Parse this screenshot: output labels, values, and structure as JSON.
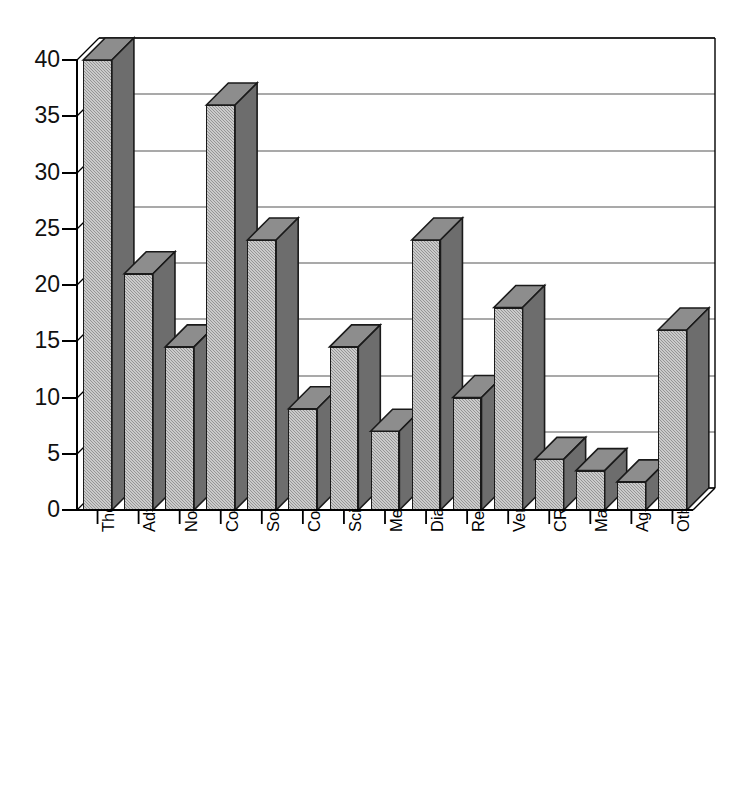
{
  "chart_data": {
    "type": "bar",
    "title": "",
    "subtitle": "",
    "xlabel": "",
    "ylabel": "",
    "ylim": [
      0,
      40
    ],
    "ytick_step": 5,
    "yticks": [
      40,
      35,
      30,
      25,
      20,
      15,
      10,
      5,
      0
    ],
    "grid": true,
    "gridlines": "horizontal",
    "legend": "none",
    "style": "3d-bar-grayscale",
    "categories": [
      "Therapeutics discovery",
      "Advanced therapeutics",
      "Non-drug therapeutics",
      "Collaborative / platform",
      "Software and databases",
      "Contract research",
      "Scientific hardware",
      "Medicines discovery",
      "Diagnostics",
      "Research reagents",
      "Very early research",
      "CRO /development",
      "Management systems",
      "Ag-bio",
      "Other"
    ],
    "values": [
      40,
      21,
      14.5,
      36,
      24,
      9,
      14.5,
      7,
      24,
      10,
      18,
      4.5,
      3.5,
      2.5,
      16
    ],
    "series": [
      {
        "name": "Count",
        "values": [
          40,
          21,
          14.5,
          36,
          24,
          9,
          14.5,
          7,
          24,
          10,
          18,
          4.5,
          3.5,
          2.5,
          16
        ]
      }
    ],
    "colors": {
      "bar_front": "#a8a8a8",
      "bar_side": "#6d6d6d",
      "bar_top": "#8d8d8d",
      "outline": "#1a1a1a",
      "gridline": "#4d4d4d",
      "axis": "#000000",
      "background": "#ffffff"
    }
  }
}
